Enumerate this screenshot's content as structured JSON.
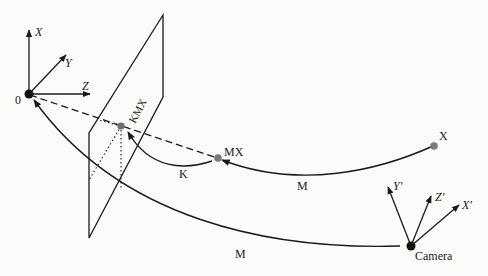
{
  "diagram": {
    "type": "camera projection / coordinate transformation diagram",
    "colors": {
      "line": "#1a1a1a",
      "point_gray": "#7a7a7a",
      "point_black": "#111111",
      "background": "#fbfbf9"
    },
    "world_frame": {
      "origin_label": "0",
      "axes": {
        "x": "X",
        "y": "Y",
        "z": "Z"
      }
    },
    "camera_frame": {
      "label": "Camera",
      "axes": {
        "x": "X'",
        "y": "Y'",
        "z": "Z'"
      }
    },
    "points": {
      "x": "X",
      "mx": "MX",
      "kmx": "KMX"
    },
    "transforms": {
      "m_upper": "M",
      "m_lower": "M",
      "k": "K"
    }
  }
}
